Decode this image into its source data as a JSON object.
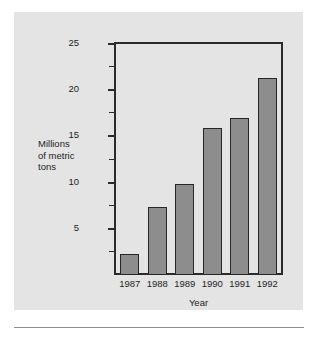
{
  "figure": {
    "background_color": "#e4e4e4",
    "page_color": "#ffffff",
    "rule_color": "#8e8e8e"
  },
  "chart_data": {
    "type": "bar",
    "title": "",
    "subtitle": "",
    "xlabel": "Year",
    "ylabel": "Millions of metric tons",
    "ylabel_lines": [
      "Millions",
      "of metric",
      "tons"
    ],
    "categories": [
      "1987",
      "1988",
      "1989",
      "1990",
      "1991",
      "1992"
    ],
    "values": [
      2.3,
      7.4,
      9.8,
      15.9,
      17.0,
      21.3
    ],
    "ylim": [
      0,
      25
    ],
    "xlim_categories": 6,
    "y_major_ticks": [
      5,
      10,
      15,
      20,
      25
    ],
    "y_major_tick_labels": [
      "5",
      "10",
      "15",
      "20",
      "25"
    ],
    "y_minor_ticks": [
      2.5,
      7.5,
      12.5,
      17.5,
      22.5
    ],
    "grid": false,
    "legend": null,
    "legend_position": "none",
    "bar_fill_color": "#8d8d8d",
    "bar_edge_color": "#262626",
    "axis_color": "#2b2b2b"
  }
}
